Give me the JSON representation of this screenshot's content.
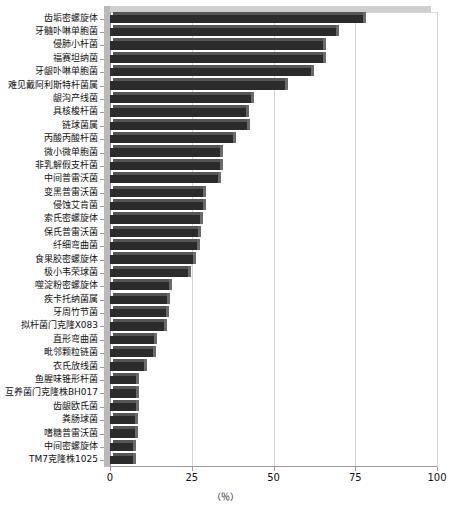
{
  "chart_data": {
    "type": "bar",
    "orientation": "horizontal",
    "title": "",
    "xlabel": "（％）",
    "ylabel": "",
    "xlim": [
      0,
      100
    ],
    "xticks": [
      0,
      25,
      50,
      75,
      100
    ],
    "xtick_labels": [
      "0",
      "25",
      "50",
      "75",
      "100"
    ],
    "grid": true,
    "grid_axis": "x",
    "legend": "none",
    "bar_color": "#2b2b2b",
    "categories": [
      "齿垢密螺旋体",
      "牙髓卟啉单胞菌",
      "侵肺小杆菌",
      "福赛坦纳菌",
      "牙龈卟啉单胞菌",
      "难见戴阿利斯特杆菌属",
      "龈沟产线菌",
      "具核梭杆菌",
      "链球菌属",
      "丙酸丙酸杆菌",
      "微小微单胞菌",
      "非乳解假支杆菌",
      "中间普雷沃菌",
      "变黑普雷沃菌",
      "侵蚀艾肯菌",
      "索氏密螺旋体",
      "保氏普雷沃菌",
      "纤细弯曲菌",
      "食果胶密螺旋体",
      "极小韦荣球菌",
      "噬淀粉密螺旋体",
      "疾卡托纳菌属",
      "牙周竹节菌",
      "拟杆菌门克隆X083",
      "直形弯曲菌",
      "毗邻颗粒链菌",
      "衣氏放线菌",
      "鱼腥味锥形杆菌",
      "互养菌门克隆株BH017",
      "齿龈欧氏菌",
      "粪肠球菌",
      "嗜糖普雷沃菌",
      "中间密螺旋体",
      "TM7克隆株1025"
    ],
    "values": [
      77.5,
      69.0,
      65.0,
      65.0,
      61.5,
      53.5,
      43.0,
      41.5,
      42.0,
      37.5,
      33.5,
      33.5,
      33.0,
      28.5,
      28.5,
      27.5,
      27.0,
      26.5,
      25.5,
      24.0,
      18.0,
      17.5,
      17.0,
      16.5,
      13.5,
      13.0,
      10.5,
      8.0,
      8.0,
      8.0,
      7.5,
      7.5,
      7.0,
      7.0
    ]
  }
}
